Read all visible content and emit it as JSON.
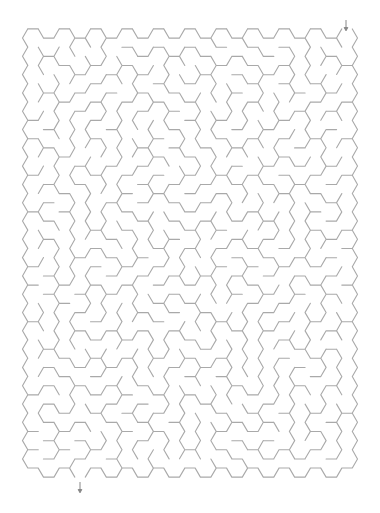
{
  "puzzle": {
    "type": "hexagonal-maze",
    "line_color": "#a9a9a9",
    "arrow_color": "#888888",
    "background": "#ffffff",
    "grid": {
      "columns": 21,
      "rows": 24,
      "hex_side": 10.5,
      "origin_x": 33,
      "origin_y": 38,
      "col_spacing": 15.7,
      "row_spacing": 18.3
    },
    "entrance": {
      "label": "start-arrow",
      "x": 346,
      "y1": 20,
      "y2": 30,
      "column": 20
    },
    "exit": {
      "label": "end-arrow",
      "x": 80,
      "y1": 482,
      "y2": 492,
      "column": 3
    }
  }
}
